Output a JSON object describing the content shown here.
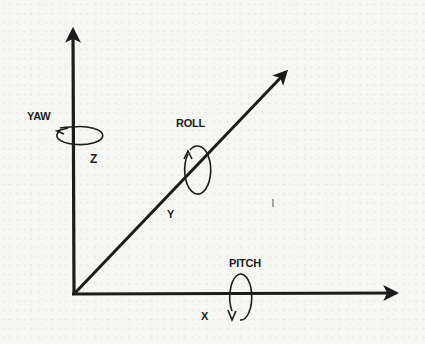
{
  "diagram": {
    "type": "3d-axis-rotation",
    "colors": {
      "background": "#f6f6f3",
      "ink": "#1c1c1c"
    },
    "origin": {
      "x": 74,
      "y": 294
    },
    "axes": [
      {
        "id": "z",
        "label": "Z",
        "tip": {
          "x": 73,
          "y": 23
        },
        "rotation": "YAW"
      },
      {
        "id": "y",
        "label": "Y",
        "tip": {
          "x": 291,
          "y": 67
        },
        "rotation": "ROLL"
      },
      {
        "id": "x",
        "label": "X",
        "tip": {
          "x": 402,
          "y": 293
        },
        "rotation": "PITCH"
      }
    ],
    "labels": {
      "yaw": "YAW",
      "roll": "ROLL",
      "pitch": "PITCH",
      "z": "Z",
      "y": "Y",
      "x": "X"
    }
  }
}
